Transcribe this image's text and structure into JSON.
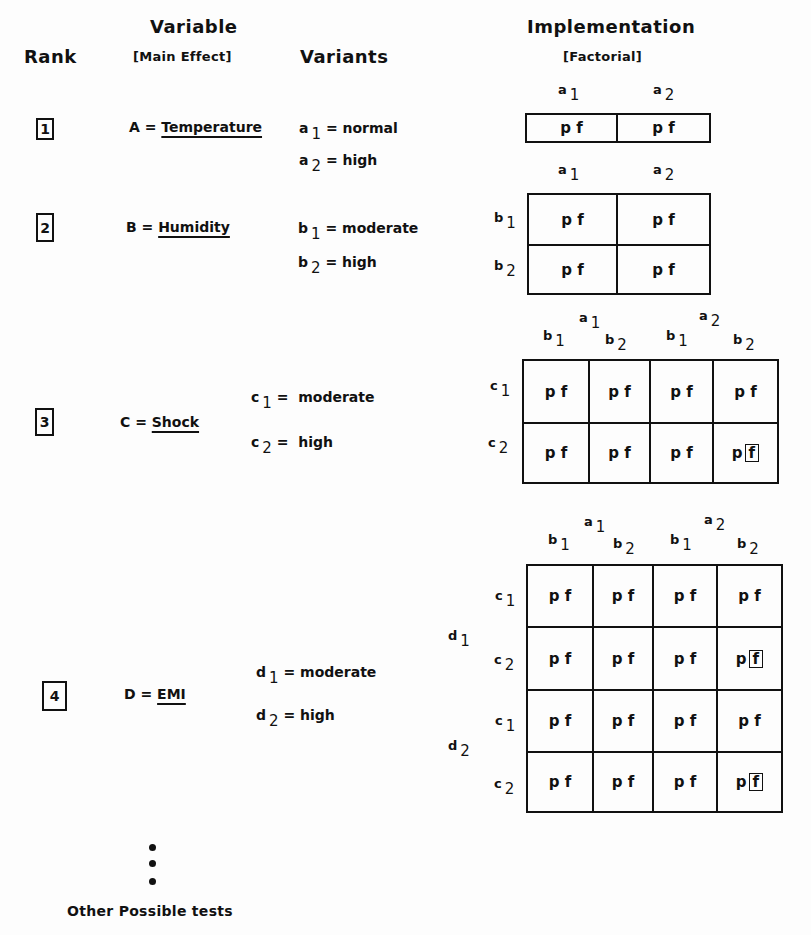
{
  "headers": {
    "rank": "Rank",
    "variable_line1": "Variable",
    "variable_line2": "[Main Effect]",
    "variants": "Variants",
    "implementation_line1": "Implementation",
    "implementation_line2": "[Factorial]"
  },
  "rows": [
    {
      "rank": "1",
      "variable_letter": "A =",
      "variable_name": "Temperature",
      "variants": [
        {
          "sym": "a",
          "sub": "1",
          "value": "= normal"
        },
        {
          "sym": "a",
          "sub": "2",
          "value": "= high"
        }
      ]
    },
    {
      "rank": "2",
      "variable_letter": "B =",
      "variable_name": "Humidity",
      "variants": [
        {
          "sym": "b",
          "sub": "1",
          "value": "= moderate"
        },
        {
          "sym": "b",
          "sub": "2",
          "value": "= high"
        }
      ]
    },
    {
      "rank": "3",
      "variable_letter": "C =",
      "variable_name": "Shock",
      "variants": [
        {
          "sym": "c",
          "sub": "1",
          "value": "=  moderate"
        },
        {
          "sym": "c",
          "sub": "2",
          "value": "=  high"
        }
      ]
    },
    {
      "rank": "4",
      "variable_letter": "D =",
      "variable_name": "EMI",
      "variants": [
        {
          "sym": "d",
          "sub": "1",
          "value": "= moderate"
        },
        {
          "sym": "d",
          "sub": "2",
          "value": "= high"
        }
      ]
    }
  ],
  "grids": {
    "cell_text": "p f",
    "cell_p": "p",
    "cell_f": "f",
    "labels": {
      "a": "a",
      "b": "b",
      "c": "c",
      "d": "d",
      "one": "1",
      "two": "2"
    },
    "grid1": {
      "rows": 1,
      "cols": 2,
      "boxed_f_cells": []
    },
    "grid2": {
      "rows": 2,
      "cols": 2,
      "boxed_f_cells": []
    },
    "grid3": {
      "rows": 2,
      "cols": 4,
      "boxed_f_cells": [
        [
          1,
          3
        ]
      ]
    },
    "grid4": {
      "rows": 4,
      "cols": 4,
      "boxed_f_cells": [
        [
          1,
          3
        ],
        [
          3,
          3
        ]
      ]
    }
  },
  "footer": {
    "ellipsis": "vertical-dots",
    "text": "Other Possible tests"
  }
}
